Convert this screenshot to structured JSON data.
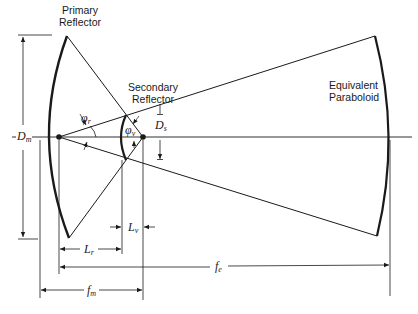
{
  "labels": {
    "primary_reflector": [
      "Primary",
      "Reflector"
    ],
    "secondary_reflector": [
      "Secondary",
      "Reflector"
    ],
    "equivalent_paraboloid": [
      "Equivalent",
      "Paraboloid"
    ]
  },
  "symbols": {
    "D_m": {
      "main": "D",
      "sub": "m"
    },
    "D_s": {
      "main": "D",
      "sub": "s"
    },
    "phi_r": {
      "main": "φ",
      "sub": "r"
    },
    "phi_v": {
      "main": "φ",
      "sub": "v"
    },
    "L_r": {
      "main": "L",
      "sub": "r"
    },
    "L_v": {
      "main": "L",
      "sub": "v"
    },
    "f_e": {
      "main": "f",
      "sub": "e"
    },
    "f_m": {
      "main": "f",
      "sub": "m"
    }
  },
  "colors": {
    "ink": "#1a1a1a",
    "background": "#ffffff"
  }
}
